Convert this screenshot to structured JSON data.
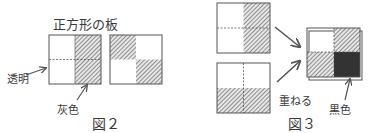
{
  "figure2": {
    "title_label": "正方形の板",
    "transparent_label": "透明",
    "gray_label": "灰色",
    "caption": "図２"
  },
  "figure3": {
    "overlap_label": "重ねる",
    "black_label": "黒色",
    "caption": "図３"
  },
  "colors": {
    "line": "#555555",
    "hatch": "#6a6a6a",
    "black": "#333333",
    "background": "#ffffff"
  }
}
